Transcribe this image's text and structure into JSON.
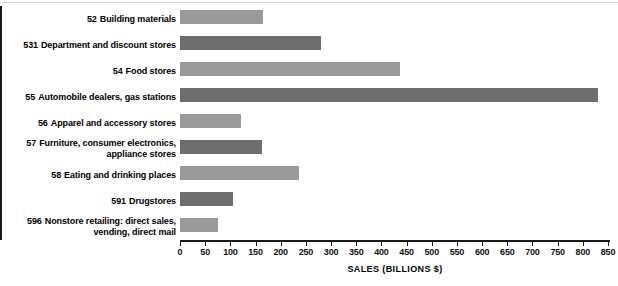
{
  "chart_data": {
    "type": "bar",
    "orientation": "horizontal",
    "title": "",
    "xlabel": "SALES (BILLIONS $)",
    "ylabel": "",
    "xlim": [
      0,
      850
    ],
    "xticks": [
      0,
      50,
      100,
      150,
      200,
      250,
      300,
      350,
      400,
      450,
      500,
      550,
      600,
      650,
      700,
      750,
      800,
      850
    ],
    "grid": false,
    "legend": false,
    "categories": [
      "Building materials",
      "Department and discount stores",
      "Food stores",
      "Automobile dealers, gas stations",
      "Apparel and accessory stores",
      "Furniture, consumer electronics, appliance stores",
      "Eating and drinking places",
      "Drugstores",
      "Nonstore retailing: direct sales, vending, direct mail"
    ],
    "category_codes": [
      "52",
      "531",
      "54",
      "55",
      "56",
      "57",
      "58",
      "591",
      "596"
    ],
    "values": [
      165,
      280,
      437,
      830,
      121,
      163,
      236,
      105,
      76
    ],
    "bar_colors": [
      "#9a9a9a",
      "#6e6e6e",
      "#9a9a9a",
      "#6e6e6e",
      "#9a9a9a",
      "#6e6e6e",
      "#9a9a9a",
      "#6e6e6e",
      "#9a9a9a"
    ],
    "label_lines": [
      [
        "Building materials"
      ],
      [
        "Department and discount stores"
      ],
      [
        "Food stores"
      ],
      [
        "Automobile dealers, gas stations"
      ],
      [
        "Apparel and accessory stores"
      ],
      [
        "Furniture, consumer electronics,",
        "appliance stores"
      ],
      [
        "Eating and drinking places"
      ],
      [
        "Drugstores"
      ],
      [
        "Nonstore retailing: direct sales,",
        "vending, direct mail"
      ]
    ]
  }
}
